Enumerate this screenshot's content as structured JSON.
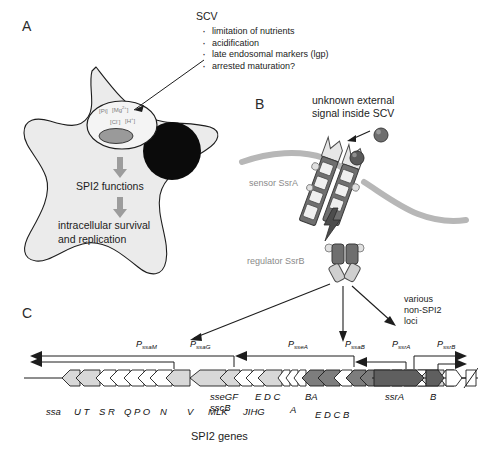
{
  "panels": {
    "a_letter": "A",
    "b_letter": "B",
    "c_letter": "C"
  },
  "panel_a": {
    "scv_title": "SCV",
    "bullets": [
      "limitation of nutrients",
      "acidification",
      "late endosomal markers (lgp)",
      "arrested maturation?"
    ],
    "vacuole_ions": {
      "pi": "[Pi]",
      "mg": "[Mg",
      "mg_sup": "2+",
      "mg_end": "]",
      "cl": "[Cl",
      "cl_sup": "-",
      "cl_end": "]",
      "h": "[H",
      "h_sup": "+",
      "h_end": "]"
    },
    "functions_label": "SPI2 functions",
    "outcome_line1": "intracellular survival",
    "outcome_line2": "and replication"
  },
  "panel_b": {
    "signal_line1": "unknown external",
    "signal_line2": "signal inside SCV",
    "sensor_label": "sensor SsrA",
    "regulator_label": "regulator SsrB",
    "various_line1": "various",
    "various_line2": "non-SPI2",
    "various_line3": "loci"
  },
  "panel_c": {
    "promoters": [
      {
        "p": "P",
        "sub": "ssaM"
      },
      {
        "p": "P",
        "sub": "ssaG"
      },
      {
        "p": "P",
        "sub": "sseA"
      },
      {
        "p": "P",
        "sub": "ssaB"
      },
      {
        "p": "P",
        "sub": "ssrA"
      },
      {
        "p": "P",
        "sub": "ssrB"
      }
    ],
    "gene_labels_upper": [
      "sseGF",
      "E D C",
      "BA",
      "ssrA",
      "B"
    ],
    "gene_labels_lower": [
      "ssa",
      "U T",
      "S R",
      "Q P O",
      "N",
      "V",
      "MLK",
      "JIHG",
      "sscB",
      "A",
      "E D  C  B"
    ],
    "caption": "SPI2 genes"
  },
  "colors": {
    "cytoplasm": "#ebebeb",
    "outline": "#1d1d1d",
    "nucleus": "#0b0b0b",
    "bacterium": "#9a9a9a",
    "arrow_gray": "#9c9c9c",
    "membrane": "#b7b7b7",
    "gene_light": "#d8d8d8",
    "gene_dark": "#7d7d7d",
    "gene_white": "#ffffff",
    "label_gray": "#8a8a8a"
  }
}
